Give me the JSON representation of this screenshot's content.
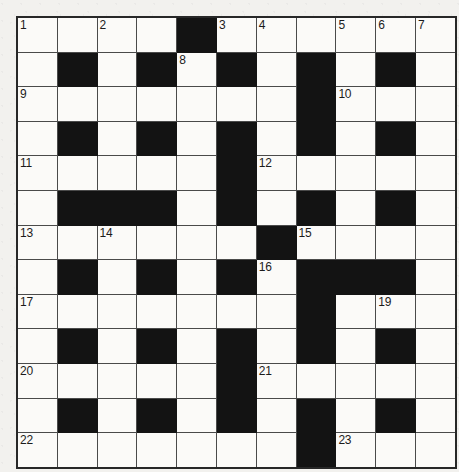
{
  "puzzle": {
    "title": "Crossword Grid",
    "columns": 11,
    "rows": 13,
    "colors": {
      "block": "#131313",
      "open_cell": "#fbfaf8",
      "grid_line": "#4a4a4a",
      "border": "#272727",
      "page_background": "#f2f1ee",
      "number_text": "#1b1b1b"
    },
    "legend": {
      "block_symbol": "#",
      "open_symbol": "."
    },
    "grid": [
      "....#......",
      ".#.#.#.#.#.",
      ".......#...",
      ".#.#.#.#.#.",
      ".....#.....",
      ".###.#.#.#.",
      "......#....",
      ".#.#.#.###.",
      ".......#...",
      ".#.#.#.#.#.",
      ".....#.....",
      ".#.#.#.#.#.",
      ".......#..."
    ],
    "numbers": [
      {
        "number": "1",
        "row": 0,
        "col": 0
      },
      {
        "number": "2",
        "row": 0,
        "col": 2
      },
      {
        "number": "3",
        "row": 0,
        "col": 5
      },
      {
        "number": "4",
        "row": 0,
        "col": 6
      },
      {
        "number": "5",
        "row": 0,
        "col": 8
      },
      {
        "number": "6",
        "row": 0,
        "col": 9
      },
      {
        "number": "7",
        "row": 0,
        "col": 10
      },
      {
        "number": "8",
        "row": 1,
        "col": 4
      },
      {
        "number": "9",
        "row": 2,
        "col": 0
      },
      {
        "number": "10",
        "row": 2,
        "col": 8
      },
      {
        "number": "11",
        "row": 4,
        "col": 0
      },
      {
        "number": "12",
        "row": 4,
        "col": 6
      },
      {
        "number": "13",
        "row": 6,
        "col": 0
      },
      {
        "number": "14",
        "row": 6,
        "col": 2
      },
      {
        "number": "15",
        "row": 6,
        "col": 7
      },
      {
        "number": "16",
        "row": 7,
        "col": 6
      },
      {
        "number": "17",
        "row": 8,
        "col": 0
      },
      {
        "number": "18",
        "row": 8,
        "col": 7
      },
      {
        "number": "19",
        "row": 8,
        "col": 9
      },
      {
        "number": "20",
        "row": 10,
        "col": 0
      },
      {
        "number": "21",
        "row": 10,
        "col": 6
      },
      {
        "number": "22",
        "row": 12,
        "col": 0
      },
      {
        "number": "23",
        "row": 12,
        "col": 8
      }
    ]
  }
}
